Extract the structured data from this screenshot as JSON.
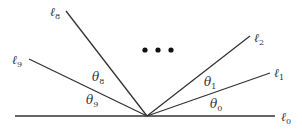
{
  "diagram": {
    "type": "angle-fan",
    "origin": {
      "x": 147,
      "y": 116
    },
    "lines": [
      {
        "id": "l0",
        "label": "ℓ",
        "sub": "0",
        "x1": 15,
        "y1": 116,
        "x2": 275,
        "y2": 116,
        "lx": 281,
        "ly": 121
      },
      {
        "id": "l1",
        "label": "ℓ",
        "sub": "1",
        "x1": 147,
        "y1": 116,
        "x2": 270,
        "y2": 73,
        "lx": 274,
        "ly": 77
      },
      {
        "id": "l2",
        "label": "ℓ",
        "sub": "2",
        "x1": 147,
        "y1": 116,
        "x2": 250,
        "y2": 36,
        "lx": 254,
        "ly": 42
      },
      {
        "id": "l8",
        "label": "ℓ",
        "sub": "8",
        "x1": 147,
        "y1": 116,
        "x2": 66,
        "y2": 11,
        "lx": 50,
        "ly": 16
      },
      {
        "id": "l9",
        "label": "ℓ",
        "sub": "9",
        "x1": 147,
        "y1": 116,
        "x2": 29,
        "y2": 59,
        "lx": 12,
        "ly": 64
      }
    ],
    "angles": [
      {
        "id": "theta0",
        "label": "θ",
        "sub": "0",
        "x": 210,
        "y": 108
      },
      {
        "id": "theta1",
        "label": "θ",
        "sub": "1",
        "x": 204,
        "y": 86
      },
      {
        "id": "theta8",
        "label": "θ",
        "sub": "8",
        "x": 92,
        "y": 81
      },
      {
        "id": "theta9",
        "label": "θ",
        "sub": "9",
        "x": 86,
        "y": 104
      }
    ],
    "ellipsis": {
      "dots": [
        {
          "x": 145,
          "y": 50
        },
        {
          "x": 158,
          "y": 50
        },
        {
          "x": 171,
          "y": 50
        }
      ],
      "radius": 2.6
    },
    "colors": {
      "stroke": "#333333",
      "dot": "#111111",
      "background": "#ffffff"
    }
  }
}
